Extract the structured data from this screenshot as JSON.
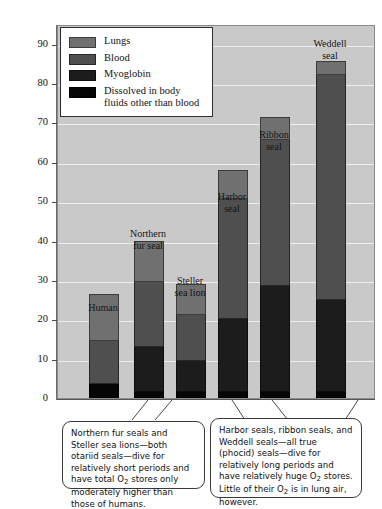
{
  "chart_data": {
    "type": "bar",
    "subtype": "stacked-bar",
    "title": "",
    "xlabel": "",
    "ylabel": "Oxygen stores (mL O2/kg)",
    "ylabel_parts": {
      "pre": "Oxygen stores (mL O",
      "sub": "2",
      "post": "/kg)"
    },
    "ylim": [
      0,
      95
    ],
    "yticks": [
      0,
      10,
      20,
      30,
      40,
      50,
      60,
      70,
      80,
      90
    ],
    "ytick_labels": [
      "0",
      "10",
      "20",
      "30",
      "40",
      "50",
      "60",
      "70",
      "80",
      "90"
    ],
    "grid": "horizontal-white",
    "legend_position": "top-left-inside",
    "categories": [
      "Human",
      "Northern fur seal",
      "Steller sea lion",
      "Harbor seal",
      "Ribbon seal",
      "Weddell seal"
    ],
    "category_labels": [
      "Human",
      "Northern\nfur seal",
      "Steller\nsea lion",
      "Harbor\nseal",
      "Ribbon\nseal",
      "Weddell\nseal"
    ],
    "series": [
      {
        "name": "Dissolved in body fluids other than blood",
        "color": "#050505",
        "values": [
          4.0,
          2.0,
          2.0,
          2.0,
          2.0,
          2.0
        ]
      },
      {
        "name": "Myoglobin",
        "color": "#1c1c1c",
        "values": [
          0.0,
          11.5,
          8.0,
          18.5,
          27.0,
          23.5
        ]
      },
      {
        "name": "Blood",
        "color": "#4f4f4f",
        "values": [
          11.0,
          16.5,
          11.5,
          30.5,
          37.0,
          57.0
        ]
      },
      {
        "name": "Lungs",
        "color": "#707070",
        "values": [
          12.0,
          10.5,
          8.0,
          7.5,
          6.0,
          3.5
        ]
      }
    ],
    "totals": [
      27.0,
      40.5,
      29.5,
      58.5,
      72.0,
      86.0
    ],
    "cumulative_tops": [
      [
        4.0,
        4.0,
        15.0,
        27.0
      ],
      [
        2.0,
        13.5,
        30.0,
        40.5
      ],
      [
        2.0,
        10.0,
        21.5,
        29.5
      ],
      [
        2.0,
        20.5,
        51.0,
        58.5
      ],
      [
        2.0,
        29.0,
        66.0,
        72.0
      ],
      [
        2.0,
        25.5,
        82.5,
        86.0
      ]
    ]
  },
  "legend": {
    "items": [
      {
        "label": "Lungs",
        "swatch": "lungs-swatch",
        "color": "#707070"
      },
      {
        "label": "Blood",
        "swatch": "blood-swatch",
        "color": "#4f4f4f"
      },
      {
        "label": "Myoglobin",
        "swatch": "myoglobin-swatch",
        "color": "#1c1c1c"
      },
      {
        "label": "Dissolved in body\nfluids other than blood",
        "swatch": "dissolved-swatch",
        "color": "#050505"
      }
    ]
  },
  "callouts": {
    "left": "Northern fur seals and Steller sea lions—both otariid seals—dive for relatively short periods and have total O2 stores only moderately higher than those of humans.",
    "left_segments": [
      {
        "t": "Northern fur seals and Steller sea lions—both otariid seals—dive for relatively short periods and have total O"
      },
      {
        "sub": "2"
      },
      {
        "t": " stores only moderately higher than those of humans."
      }
    ],
    "right": "Harbor seals, ribbon seals, and Weddell seals—all true (phocid) seals—dive for relatively long periods and have relatively huge O2 stores.  Little of their O2 is in lung air, however.",
    "right_segments": [
      {
        "t": "Harbor seals, ribbon seals, and Weddell seals—all true (phocid) seals—dive for relatively long periods and have relatively huge O"
      },
      {
        "sub": "2"
      },
      {
        "t": " stores.  Little of their O"
      },
      {
        "sub": "2"
      },
      {
        "t": " is in lung air, however."
      }
    ]
  },
  "colors": {
    "plot_background": "#c9c9c9",
    "gridline": "#eeeeee",
    "page_background": "#ffffff",
    "text": "#111111"
  }
}
